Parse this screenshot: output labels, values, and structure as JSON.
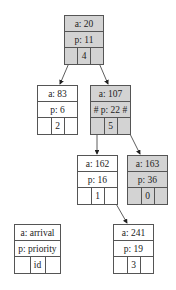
{
  "colors": {
    "highlight": "#d3d3d3",
    "normal": "#ffffff",
    "border": "#555555"
  },
  "nodes": [
    {
      "key": "root",
      "a": "a: 20",
      "p": "p: 11",
      "id": "4",
      "highlighted": true,
      "x": 64,
      "y": 15,
      "w": 40
    },
    {
      "key": "n83",
      "a": "a: 83",
      "p": "p: 6",
      "id": "2",
      "highlighted": false,
      "x": 37,
      "y": 85,
      "w": 41
    },
    {
      "key": "n107",
      "a": "a: 107",
      "p": "# p: 22 #",
      "id": "5",
      "highlighted": true,
      "x": 90,
      "y": 85,
      "w": 41
    },
    {
      "key": "n162",
      "a": "a: 162",
      "p": "p: 16",
      "id": "1",
      "highlighted": false,
      "x": 77,
      "y": 155,
      "w": 41
    },
    {
      "key": "n163",
      "a": "a: 163",
      "p": "p: 36",
      "id": "0",
      "highlighted": true,
      "x": 127,
      "y": 155,
      "w": 41
    },
    {
      "key": "n241",
      "a": "a: 241",
      "p": "p: 19",
      "id": "3",
      "highlighted": false,
      "x": 113,
      "y": 224,
      "w": 41
    }
  ],
  "legend": {
    "a": "a: arrival",
    "p": "p: priority",
    "id": "id"
  },
  "edges": [
    {
      "from": "root",
      "to": "n83"
    },
    {
      "from": "root",
      "to": "n107"
    },
    {
      "from": "n107",
      "to": "n162"
    },
    {
      "from": "n107",
      "to": "n163"
    },
    {
      "from": "n162",
      "to": "n241"
    }
  ]
}
